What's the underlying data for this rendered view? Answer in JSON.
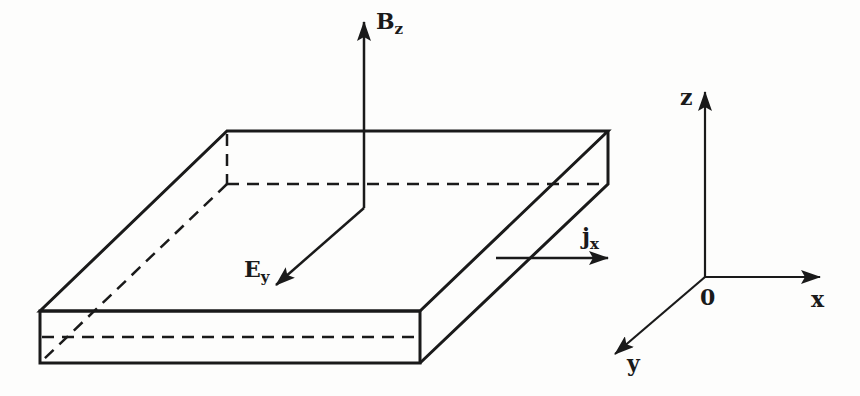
{
  "figure": {
    "line_color": "#1a1a1a",
    "background": "#fdfdfc"
  },
  "labels": {
    "magnetic_field": {
      "main": "B",
      "sub": "z"
    },
    "electric_field": {
      "main": "E",
      "sub": "y"
    },
    "current_density": {
      "main": "j",
      "sub": "x"
    }
  },
  "axes": {
    "z_label": "z",
    "x_label": "x",
    "y_label": "y",
    "origin_label": "0"
  }
}
